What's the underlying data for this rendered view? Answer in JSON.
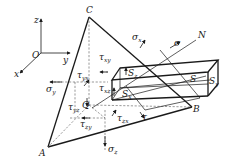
{
  "figure": {
    "axes": {
      "origin_label": "O",
      "x_label": "x",
      "y_label": "y",
      "z_label": "z"
    },
    "vertices": {
      "A": "A",
      "B": "B",
      "C": "C",
      "Q": "Q"
    },
    "normal_label": "N",
    "stresses": {
      "sigma": "σ",
      "tau": "τ",
      "sigma_x": "σ",
      "sigma_x_sub": "x",
      "sigma_y": "σ",
      "sigma_y_sub": "y",
      "sigma_z": "σ",
      "sigma_z_sub": "z",
      "tau_xy": "τ",
      "tau_xy_sub": "xy",
      "tau_yx": "τ",
      "tau_yx_sub": "yx",
      "tau_yz": "τ",
      "tau_yz_sub": "yz",
      "tau_zy": "τ",
      "tau_zy_sub": "zy",
      "tau_xz": "τ",
      "tau_xz_sub": "xz",
      "tau_zx": "τ",
      "tau_zx_sub": "zx"
    },
    "areas": {
      "S": "S",
      "Sx": "S",
      "Sx_sub": "x",
      "Sz": "S",
      "Sz_sub": "z",
      "Sy": "S",
      "Sy_sub": "y"
    },
    "colors": {
      "line": "#1a1a1a",
      "dashed": "#555555",
      "background": "#ffffff"
    }
  }
}
